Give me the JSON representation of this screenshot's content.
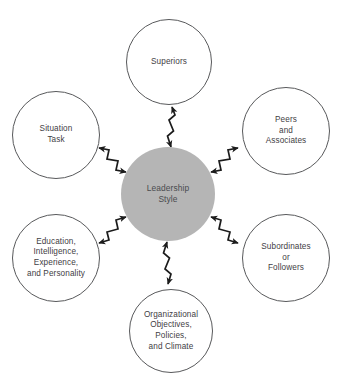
{
  "diagram": {
    "background_color": "#ffffff",
    "center_fill": "#b5b5b5",
    "outline_color": "#58595b",
    "text_color": "#3f4044",
    "center": {
      "id": "leadership-style",
      "label": "Leadership\nStyle",
      "shape": "circle",
      "cx": 168,
      "cy": 194,
      "r": 47
    },
    "nodes": [
      {
        "id": "superiors",
        "label": "Superiors",
        "shape": "circle",
        "cx": 169,
        "cy": 62,
        "r": 43
      },
      {
        "id": "peers-and-associates",
        "label": "Peers\nand\nAssociates",
        "shape": "circle",
        "cx": 286,
        "cy": 131,
        "r": 44
      },
      {
        "id": "subordinates-or-followers",
        "label": "Subordinates\nor\nFollowers",
        "shape": "circle",
        "cx": 286,
        "cy": 258,
        "r": 44
      },
      {
        "id": "organizational-objectives",
        "label": "Organizational\nObjectives,\nPolicies,\nand Climate",
        "shape": "circle",
        "cx": 171,
        "cy": 331,
        "r": 42
      },
      {
        "id": "education-intelligence",
        "label": "Education,\nIntelligence,\nExperience,\nand Personality",
        "shape": "circle",
        "cx": 56,
        "cy": 258,
        "r": 44
      },
      {
        "id": "situation-task",
        "label": "Situation\nTask",
        "shape": "circle",
        "cx": 56,
        "cy": 135,
        "r": 44
      }
    ],
    "connectors": [
      {
        "id": "connector-superiors",
        "from": "superiors",
        "to": "leadership-style",
        "style": "lightning-double-arrow"
      },
      {
        "id": "connector-peers",
        "from": "peers-and-associates",
        "to": "leadership-style",
        "style": "lightning-double-arrow"
      },
      {
        "id": "connector-subordinates",
        "from": "subordinates-or-followers",
        "to": "leadership-style",
        "style": "lightning-double-arrow"
      },
      {
        "id": "connector-organizational",
        "from": "organizational-objectives",
        "to": "leadership-style",
        "style": "lightning-double-arrow"
      },
      {
        "id": "connector-education",
        "from": "education-intelligence",
        "to": "leadership-style",
        "style": "lightning-double-arrow"
      },
      {
        "id": "connector-situation",
        "from": "situation-task",
        "to": "leadership-style",
        "style": "lightning-double-arrow"
      }
    ]
  }
}
